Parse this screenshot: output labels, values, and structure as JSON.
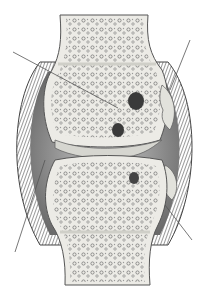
{
  "diagram": {
    "background": "#ffffff",
    "colors": {
      "bone_fill": "#ecebe6",
      "bone_outline": "#555555",
      "trabecula": "#8a8a8a",
      "capsule_dark": "#4a4a4a",
      "capsule_mid": "#7a7a7a",
      "joint_cavity": "#9a9a9a",
      "cartilage": "#d6d6d0",
      "leader_line": "#555555",
      "lesion": "#3a3a3a"
    },
    "leader_lines": [
      {
        "id": "upper-left",
        "x1": 13,
        "y1": 52,
        "x2": 118,
        "y2": 108,
        "label": ""
      },
      {
        "id": "upper-right",
        "x1": 190,
        "y1": 40,
        "x2": 170,
        "y2": 90,
        "label": ""
      },
      {
        "id": "lower-left",
        "x1": 15,
        "y1": 252,
        "x2": 45,
        "y2": 160,
        "label": ""
      },
      {
        "id": "lower-right",
        "x1": 192,
        "y1": 240,
        "x2": 165,
        "y2": 205,
        "label": ""
      }
    ]
  }
}
